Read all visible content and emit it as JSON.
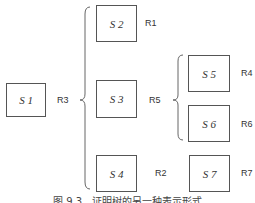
{
  "diagram": {
    "nodes": [
      {
        "id": "S1",
        "label": "S 1"
      },
      {
        "id": "S2",
        "label": "S 2"
      },
      {
        "id": "S3",
        "label": "S 3"
      },
      {
        "id": "S4",
        "label": "S 4"
      },
      {
        "id": "S5",
        "label": "S 5"
      },
      {
        "id": "S6",
        "label": "S 6"
      },
      {
        "id": "S7",
        "label": "S 7"
      }
    ],
    "rules": {
      "R1": "R1",
      "R2": "R2",
      "R3": "R3",
      "R4": "R4",
      "R5": "R5",
      "R6": "R6",
      "R7": "R7"
    },
    "groups": [
      {
        "parent": "S1",
        "rule": "R3",
        "children": [
          "S2",
          "S3",
          "S4"
        ]
      },
      {
        "parent": "S3",
        "rule": "R5",
        "children": [
          "S5",
          "S6"
        ]
      }
    ],
    "caption": "图 9.3　证明树的另一种表示形式"
  },
  "colors": {
    "stroke": "#555555",
    "text": "#333333"
  }
}
